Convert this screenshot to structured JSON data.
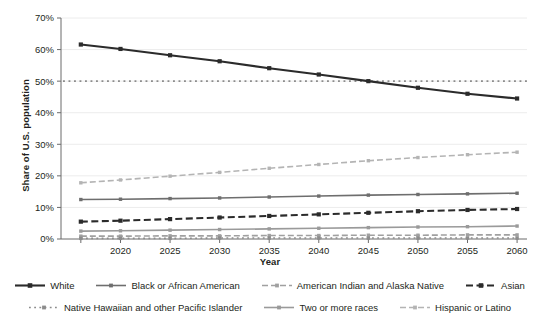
{
  "chart_data": {
    "type": "line",
    "title": "",
    "xlabel": "Year",
    "ylabel": "Share of U.S. population",
    "x": [
      2016,
      2020,
      2025,
      2030,
      2035,
      2040,
      2045,
      2050,
      2055,
      2060
    ],
    "xlim": [
      2014,
      2061
    ],
    "ylim": [
      0,
      70
    ],
    "xticks": [
      2020,
      2025,
      2030,
      2035,
      2040,
      2045,
      2050,
      2055,
      2060
    ],
    "xtick_labels": [
      "2020",
      "2025",
      "2030",
      "2035",
      "2040",
      "2045",
      "2050",
      "2055",
      "2060"
    ],
    "yticks": [
      0,
      10,
      20,
      30,
      40,
      50,
      60,
      70
    ],
    "ytick_labels": [
      "0%",
      "10%",
      "20%",
      "30%",
      "40%",
      "50%",
      "60%",
      "70%"
    ],
    "grid": "horizontal",
    "legend_position": "bottom",
    "reference_line": {
      "name": "fifty-percent-reference",
      "value": 50,
      "style": "dotted",
      "color": "#8c8c8c"
    },
    "series": [
      {
        "name": "White",
        "color": "#2b2b2b",
        "style": "solid",
        "marker": "square",
        "values": [
          61.6,
          60.2,
          58.2,
          56.3,
          54.1,
          52.1,
          50.0,
          47.9,
          46.0,
          44.5
        ]
      },
      {
        "name": "Black or African American",
        "color": "#6e6e6e",
        "style": "solid",
        "marker": "square",
        "values": [
          12.5,
          12.6,
          12.8,
          13.0,
          13.3,
          13.6,
          13.9,
          14.1,
          14.3,
          14.5
        ]
      },
      {
        "name": "American Indian and Alaska Native",
        "color": "#a0a0a0",
        "style": "dashed",
        "marker": "square",
        "values": [
          0.9,
          0.9,
          1.0,
          1.0,
          1.1,
          1.1,
          1.2,
          1.2,
          1.3,
          1.3
        ]
      },
      {
        "name": "Asian",
        "color": "#2b2b2b",
        "style": "dashed",
        "marker": "square",
        "values": [
          5.5,
          5.8,
          6.3,
          6.8,
          7.3,
          7.8,
          8.3,
          8.8,
          9.2,
          9.5
        ]
      },
      {
        "name": "Native Hawaiian and other Pacific Islander",
        "color": "#8c8c8c",
        "style": "dotted",
        "marker": "square",
        "values": [
          0.2,
          0.2,
          0.2,
          0.3,
          0.3,
          0.3,
          0.3,
          0.3,
          0.3,
          0.3
        ]
      },
      {
        "name": "Two or more races",
        "color": "#9a9a9a",
        "style": "solid",
        "marker": "square",
        "values": [
          2.5,
          2.6,
          2.8,
          3.0,
          3.2,
          3.4,
          3.6,
          3.8,
          3.9,
          4.1
        ]
      },
      {
        "name": "Hispanic or Latino",
        "color": "#b4b4b4",
        "style": "dashed",
        "marker": "square",
        "values": [
          17.8,
          18.7,
          19.9,
          21.1,
          22.4,
          23.6,
          24.8,
          25.8,
          26.7,
          27.5
        ]
      }
    ]
  }
}
